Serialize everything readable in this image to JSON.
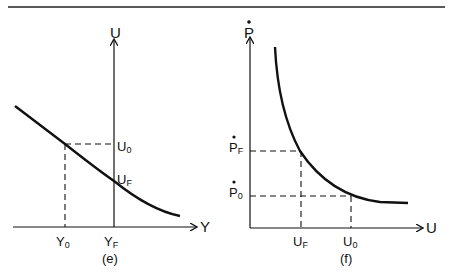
{
  "figure": {
    "panel_e": {
      "caption": "(e)",
      "y_axis_label": "U",
      "x_axis_label": "Y",
      "y_ticks": [
        {
          "main": "U",
          "sub": "0"
        },
        {
          "main": "U",
          "sub": "F"
        }
      ],
      "x_ticks": [
        {
          "main": "Y",
          "sub": "0"
        },
        {
          "main": "Y",
          "sub": "F"
        }
      ]
    },
    "panel_f": {
      "caption": "(f)",
      "y_axis_label": "P",
      "y_axis_dot": true,
      "x_axis_label": "U",
      "y_ticks": [
        {
          "main": "P",
          "sub": "F",
          "dot": true
        },
        {
          "main": "P",
          "sub": "0",
          "dot": true
        }
      ],
      "x_ticks": [
        {
          "main": "U",
          "sub": "F"
        },
        {
          "main": "U",
          "sub": "0"
        }
      ]
    }
  },
  "colors": {
    "ink": "#111111",
    "background": "#ffffff"
  }
}
